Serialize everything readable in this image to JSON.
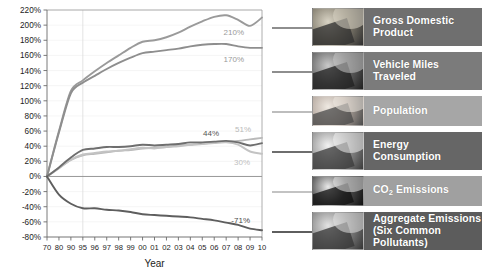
{
  "chart_data": {
    "type": "line",
    "title": "",
    "xlabel": "Year",
    "ylabel": "",
    "ylim": [
      -80,
      220
    ],
    "ytick_step": 20,
    "yticks": [
      "220%",
      "200%",
      "180%",
      "160%",
      "140%",
      "120%",
      "100%",
      "80%",
      "60%",
      "40%",
      "20%",
      "0%",
      "-20%",
      "-40%",
      "-60%",
      "-80%"
    ],
    "categories": [
      "70",
      "80",
      "90",
      "95",
      "96",
      "97",
      "98",
      "99",
      "00",
      "01",
      "02",
      "03",
      "04",
      "05",
      "06",
      "07",
      "08",
      "09",
      "10"
    ],
    "grid": "light-horizontal-and-one-vertical-at-95",
    "legend_position": "right",
    "series": [
      {
        "name": "Gross Domestic Product",
        "color": "#9a9a9a",
        "end_label": "210%",
        "label_color": "#9a9a9a",
        "values": [
          0,
          60,
          113,
          127,
          139,
          150,
          160,
          170,
          178,
          180,
          184,
          190,
          198,
          205,
          211,
          213,
          207,
          199,
          210
        ]
      },
      {
        "name": "Vehicle Miles Traveled",
        "color": "#8e8e8e",
        "end_label": "170%",
        "label_color": "#9a9a9a",
        "values": [
          0,
          58,
          110,
          124,
          133,
          142,
          150,
          157,
          163,
          165,
          167,
          169,
          172,
          174,
          175,
          175,
          172,
          170,
          170
        ]
      },
      {
        "name": "Population",
        "color": "#b9b9b9",
        "end_label": "51%",
        "label_color": "#b9b9b9",
        "values": [
          0,
          11,
          22,
          28,
          30,
          32,
          34,
          35,
          37,
          38,
          39,
          41,
          42,
          43,
          45,
          46,
          47,
          49,
          51
        ]
      },
      {
        "name": "Energy Consumption",
        "color": "#6e6e6e",
        "end_label": "44%",
        "label_color": "#545454",
        "values": [
          0,
          12,
          25,
          35,
          37,
          39,
          39,
          40,
          42,
          41,
          42,
          43,
          45,
          45,
          46,
          47,
          45,
          41,
          44
        ]
      },
      {
        "name": "CO2 Emissions",
        "color": "#c3c3c3",
        "end_label": "30%",
        "label_color": "#bfbfbf",
        "values": [
          0,
          11,
          22,
          29,
          31,
          33,
          34,
          36,
          38,
          37,
          39,
          40,
          42,
          43,
          44,
          45,
          42,
          33,
          30
        ]
      },
      {
        "name": "Aggregate Emissions (Six Common Pollutants)",
        "color": "#5e5e5e",
        "end_label": "-71%",
        "label_color": "#4a4a4a",
        "values": [
          0,
          -24,
          -36,
          -42,
          -42,
          -44,
          -45,
          -47,
          -50,
          -51,
          -52,
          -53,
          -54,
          -56,
          -58,
          -61,
          -64,
          -69,
          -71
        ]
      }
    ]
  },
  "legend": {
    "items": [
      {
        "id": "gross-domestic-product",
        "label": "Gross Domestic\nProduct",
        "panel_color": "#6f6f6f",
        "connector_color": "#8e8e8e",
        "thumb": "coins-photo"
      },
      {
        "id": "vehicle-miles-traveled",
        "label": "Vehicle Miles\nTraveled",
        "panel_color": "#7b7b7b",
        "connector_color": "#8e8e8e",
        "thumb": "traffic-photo"
      },
      {
        "id": "population",
        "label": "Population",
        "panel_color": "#a6a6a6",
        "connector_color": "#bdbdbd",
        "thumb": "baby-photo"
      },
      {
        "id": "energy-consumption",
        "label": "Energy\nConsumption",
        "panel_color": "#666666",
        "connector_color": "#6e6e6e",
        "thumb": "plug-photo"
      },
      {
        "id": "co2-emissions",
        "label": "CO2 Emissions",
        "panel_color": "#a0a0a0",
        "connector_color": "#c3c3c3",
        "thumb": "exhaust-photo"
      },
      {
        "id": "aggregate-emissions",
        "label": "Aggregate Emissions\n(Six Common Pollutants)",
        "panel_color": "#5c5c5c",
        "connector_color": "#5e5e5e",
        "thumb": "smokestack-photo"
      }
    ]
  }
}
